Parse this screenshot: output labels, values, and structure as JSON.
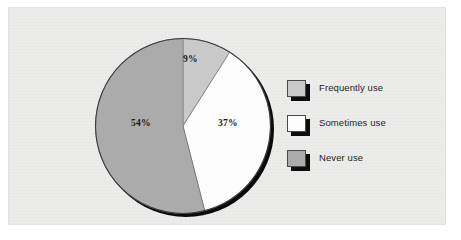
{
  "figure": {
    "panel_background": "#ececeb",
    "page_background": "#ffffff"
  },
  "chart_data": {
    "type": "pie",
    "title": "",
    "subtitle": "",
    "xlabel": "",
    "ylabel": "",
    "grid": false,
    "legend_position": "right",
    "start_angle_deg": 0,
    "direction": "clockwise",
    "units": "percent",
    "total": 100,
    "categories": [
      "Frequently use",
      "Sometimes use",
      "Never use"
    ],
    "values": [
      9,
      37,
      54
    ],
    "data_labels": [
      "9%",
      "37%",
      "54%"
    ],
    "colors": [
      "#c9c9c9",
      "#fdfdfd",
      "#ababab"
    ],
    "slices": [
      {
        "label": "Frequently use",
        "value": 9,
        "data_label": "9%",
        "color": "#c9c9c9",
        "start_deg": 0,
        "end_deg": 32.4
      },
      {
        "label": "Sometimes use",
        "value": 37,
        "data_label": "37%",
        "color": "#fdfdfd",
        "start_deg": 32.4,
        "end_deg": 165.6
      },
      {
        "label": "Never use",
        "value": 54,
        "data_label": "54%",
        "color": "#ababab",
        "start_deg": 165.6,
        "end_deg": 360
      }
    ]
  },
  "legend": {
    "items": [
      {
        "label": "Frequently use",
        "color": "#c9c9c9"
      },
      {
        "label": "Sometimes use",
        "color": "#fdfdfd"
      },
      {
        "label": "Never use",
        "color": "#ababab"
      }
    ]
  }
}
